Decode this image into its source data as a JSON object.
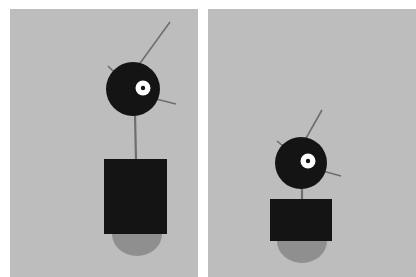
{
  "scene": {
    "title": "Two-panel figure comparison",
    "background_color": "#ffffff",
    "panel_color": "#bdbdbd",
    "figure_color": "#141414",
    "base_color": "#8f8f8f",
    "eye_outer_color": "#ffffff",
    "eye_pupil_color": "#141414",
    "antenna_color": "#6e6e6e",
    "panel_count": "2"
  },
  "panels": [
    {
      "id": "left",
      "label": "Left panel",
      "figure": {
        "name": "tall-figure",
        "head": {
          "cx": 133,
          "cy": 89,
          "r": 27,
          "eye": {
            "cx": 143,
            "cy": 88,
            "r_outer": 7.5,
            "r_pupil": 2.2
          }
        },
        "antennae": [
          {
            "name": "antenna-upper-right",
            "x1": 138,
            "y1": 66,
            "x2": 170,
            "y2": 22
          },
          {
            "name": "antenna-side-right",
            "x1": 152,
            "y1": 98,
            "x2": 176,
            "y2": 104
          },
          {
            "name": "antenna-upper-left",
            "x1": 114,
            "y1": 72,
            "x2": 108,
            "y2": 66
          }
        ],
        "neck": {
          "x1": 135,
          "y1": 114,
          "x2": 136,
          "y2": 160
        },
        "body": {
          "x": 104,
          "y": 159,
          "w": 63,
          "h": 75
        },
        "base": {
          "cx": 137,
          "cy": 234,
          "rx": 25,
          "ry": 22
        }
      }
    },
    {
      "id": "right",
      "label": "Right panel",
      "figure": {
        "name": "compact-figure",
        "head": {
          "cx": 301,
          "cy": 163,
          "r": 26,
          "eye": {
            "cx": 308,
            "cy": 161,
            "r_outer": 7.5,
            "r_pupil": 2.2
          }
        },
        "antennae": [
          {
            "name": "antenna-upper-right",
            "x1": 305,
            "y1": 140,
            "x2": 322,
            "y2": 110
          },
          {
            "name": "antenna-side-right",
            "x1": 319,
            "y1": 170,
            "x2": 341,
            "y2": 176
          },
          {
            "name": "antenna-upper-left",
            "x1": 283,
            "y1": 146,
            "x2": 277,
            "y2": 141
          }
        ],
        "neck": {
          "x1": 302,
          "y1": 186,
          "x2": 302,
          "y2": 200
        },
        "body": {
          "x": 270,
          "y": 199,
          "w": 62,
          "h": 42
        },
        "base": {
          "cx": 302,
          "cy": 241,
          "rx": 25,
          "ry": 22
        }
      }
    }
  ]
}
